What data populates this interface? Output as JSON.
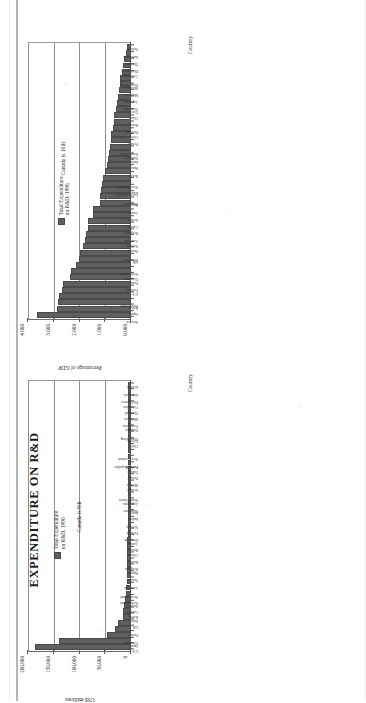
{
  "page": {
    "title": "EXPENDITURE ON R&D"
  },
  "charts": [
    {
      "id": "chart-gdp",
      "legend_label": "Total Expenditure\non R&D, 1996",
      "callout": "Canada is 16th",
      "value_axis_title": "Percentage of GDP",
      "category_axis_title": "Country",
      "ticks": [
        "0.000",
        "1.000",
        "2.000",
        "3.000",
        "4.000"
      ]
    },
    {
      "id": "chart-usd",
      "legend_label": "Total Expenditure\non R&D, 1996",
      "callout": "Canada is 8th",
      "value_axis_title": "US$ millions",
      "category_axis_title": "Country",
      "ticks": [
        "0",
        "50,000",
        "100,000",
        "150,000",
        "200,000"
      ]
    }
  ],
  "chart_data": [
    {
      "type": "bar",
      "title": "Total Expenditure on R&D, 1996",
      "xlabel": "Country",
      "ylabel": "Percentage of GDP",
      "ylim": [
        0,
        4
      ],
      "grid": true,
      "legend_position": "inside-right",
      "annotations": [
        "Canada is 16th"
      ],
      "tick_labels": [
        "0.000",
        "1.000",
        "2.000",
        "3.000",
        "4.000"
      ],
      "categories": [
        "Sweden",
        "Japan",
        "Korea",
        "Switzerland",
        "U.S.",
        "Finland",
        "France",
        "Germany",
        "Netherlands",
        "UK",
        "Denmark",
        "Taiwan",
        "Norway",
        "Australia",
        "Belgium",
        "Canada",
        "Ireland",
        "Austria",
        "Italy",
        "Singapore",
        "Israel",
        "Czech Republic",
        "New Zealand",
        "Russia",
        "Spain",
        "India",
        "Hungary",
        "South Africa",
        "Poland",
        "Chile",
        "Portugal",
        "Brazil",
        "China",
        "Greece",
        "Venezuela",
        "Argentina",
        "Malaysia",
        "Mexico",
        "Hong Kong",
        "Colombia",
        "Philippines",
        "Thailand",
        "Indonesia",
        "Turkey"
      ],
      "values": [
        3.59,
        2.83,
        2.79,
        2.74,
        2.62,
        2.58,
        2.32,
        2.28,
        2.09,
        1.95,
        1.94,
        1.8,
        1.71,
        1.68,
        1.6,
        1.59,
        1.42,
        1.41,
        1.14,
        1.13,
        1.1,
        1.04,
        1.02,
        0.94,
        0.87,
        0.84,
        0.78,
        0.74,
        0.72,
        0.69,
        0.62,
        0.6,
        0.58,
        0.52,
        0.48,
        0.44,
        0.39,
        0.36,
        0.34,
        0.28,
        0.22,
        0.19,
        0.13,
        0.08
      ]
    },
    {
      "type": "bar",
      "title": "Total Expenditure on R&D, 1996",
      "xlabel": "Country",
      "ylabel": "US$ millions",
      "ylim": [
        0,
        200000
      ],
      "grid": true,
      "legend_position": "inside-right",
      "annotations": [
        "Canada is 8th"
      ],
      "tick_labels": [
        "0",
        "50,000",
        "100,000",
        "150,000",
        "200,000"
      ],
      "categories": [
        "U.S.",
        "Japan",
        "Germany",
        "France",
        "UK",
        "Italy",
        "Korea",
        "Canada",
        "Sweden",
        "Netherlands",
        "Switzerland",
        "Australia",
        "Taiwan",
        "Spain",
        "Belgium",
        "Brazil",
        "China",
        "Russia",
        "Austria",
        "Denmark",
        "Finland",
        "Norway",
        "India",
        "Israel",
        "Singapore",
        "Argentina",
        "South Africa",
        "Ireland",
        "Mexico",
        "Poland",
        "Turkey",
        "Portugal",
        "Czech Republic",
        "New Zealand",
        "Chile",
        "Greece",
        "Hong Kong",
        "Hungary",
        "Venezuela",
        "Malaysia",
        "Thailand",
        "Colombia",
        "Philippines",
        "Indonesia",
        "Iceland"
      ],
      "values": [
        184000,
        138000,
        44000,
        27000,
        22000,
        12500,
        12000,
        10500,
        7000,
        6500,
        5500,
        4500,
        4200,
        4000,
        3800,
        3600,
        3400,
        3200,
        3000,
        2800,
        2600,
        2400,
        2300,
        2100,
        1900,
        1700,
        1600,
        1500,
        1400,
        1300,
        1200,
        1100,
        1000,
        950,
        900,
        850,
        800,
        750,
        700,
        650,
        600,
        500,
        400,
        300,
        200
      ]
    }
  ]
}
